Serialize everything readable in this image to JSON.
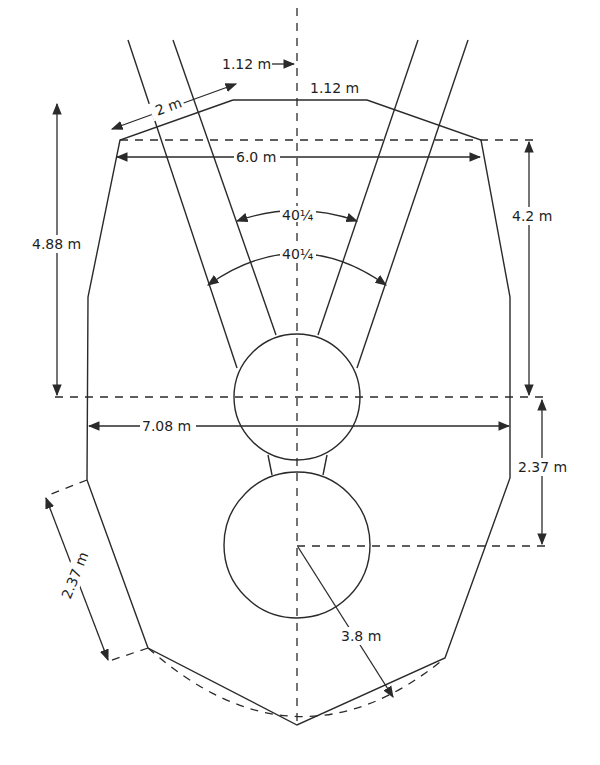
{
  "figure": {
    "type": "engineering cross-section diagram",
    "colors": {
      "line": "#2a2a2a",
      "text": "#1e1e1e",
      "background": "#ffffff"
    }
  },
  "dimensions": {
    "top_offset": "1.12 m",
    "top_flat": "1.12 m",
    "top_slope": "2 m",
    "upper_width": "6.0 m",
    "left_height": "4.88 m",
    "right_height": "4.2 m",
    "angle_inner": "40¼",
    "angle_outer": "40¼",
    "mid_width": "7.08 m",
    "right_lower": "2.37 m",
    "left_lower_slope": "2.37 m",
    "radius": "3.8 m"
  }
}
